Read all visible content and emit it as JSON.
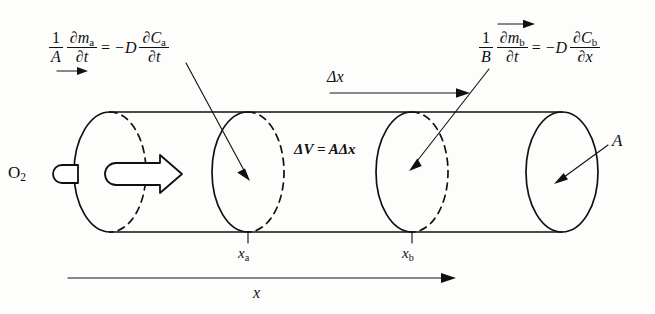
{
  "figure": {
    "background_color": "#fdfdfc",
    "ink_color": "#101010"
  },
  "equations": {
    "left": {
      "id": "flux-equation-a",
      "coefficient_num": "1",
      "coefficient_den": "A",
      "lhs_num": "∂m",
      "lhs_num_sub": "a",
      "lhs_den": "∂t",
      "equals": "=",
      "minus_d": "−D",
      "rhs_num": "∂C",
      "rhs_num_sub": "a",
      "rhs_den": "∂t",
      "plain": "1/A · ∂mₐ/∂t = −D ∂Cₐ/∂t",
      "arrow_position": "below-coefficient",
      "arrow_direction": "right"
    },
    "right": {
      "id": "flux-equation-b",
      "coefficient_num": "1",
      "coefficient_den": "B",
      "lhs_num": "∂m",
      "lhs_num_sub": "b",
      "lhs_den": "∂t",
      "equals": "=",
      "minus_d": "−D",
      "rhs_num": "∂C",
      "rhs_num_sub": "b",
      "rhs_den": "∂x",
      "plain": "1/B · ∂m_b/∂t = −D ∂C_b/∂x",
      "arrow_position": "above-numerator",
      "arrow_direction": "right"
    }
  },
  "labels": {
    "delta_x": "Δx",
    "delta_v": "ΔV = AΔx",
    "oxygen": "O",
    "oxygen_sub": "2",
    "area": "A",
    "x_a": "x",
    "x_a_sub": "a",
    "x_b": "x",
    "x_b_sub": "b",
    "axis_x": "x"
  },
  "geometry": {
    "cylinder": {
      "left_center_x": 110,
      "right_center_x": 562,
      "axis_y": 172,
      "radius_x": 36,
      "radius_y": 60,
      "top_y": 112,
      "bottom_y": 232
    },
    "cross_sections": [
      {
        "name": "x-a",
        "center_x": 248,
        "tick_label": "x_a"
      },
      {
        "name": "x-b",
        "center_x": 412,
        "tick_label": "x_b"
      }
    ],
    "delta_x_arrow": {
      "x1": 330,
      "x2": 470,
      "y": 93
    },
    "axis_arrow": {
      "x1": 68,
      "x2": 455,
      "y": 278
    }
  }
}
